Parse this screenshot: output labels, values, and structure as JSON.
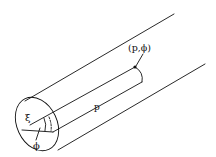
{
  "diagram": {
    "labels": {
      "point": "(p,ϕ)",
      "radial": "p",
      "xi": "ξ",
      "phi": "ϕ"
    },
    "colors": {
      "stroke": "#111111",
      "background": "#ffffff"
    }
  }
}
